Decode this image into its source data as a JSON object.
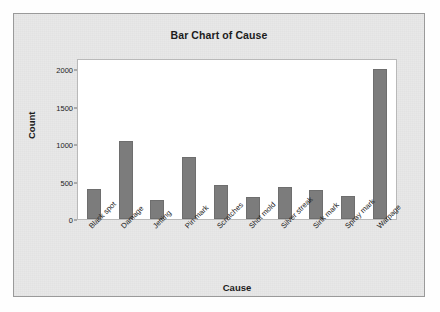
{
  "chart_data": {
    "type": "bar",
    "title": "Bar Chart of Cause",
    "xlabel": "Cause",
    "ylabel": "Count",
    "categories": [
      "Black spot",
      "Damage",
      "Jetting",
      "Pin mark",
      "Scratches",
      "Shot mold",
      "Silver streak",
      "Sink mark",
      "Spray mark",
      "Warpage"
    ],
    "values": [
      400,
      1040,
      260,
      830,
      450,
      290,
      430,
      390,
      310,
      2000
    ],
    "ylim": [
      0,
      2150
    ],
    "yticks": [
      0,
      500,
      1000,
      1500,
      2000
    ],
    "ytick_labels": [
      "0",
      "500",
      "1000",
      "1500",
      "2000"
    ],
    "grid": false,
    "legend": "none",
    "bar_color": "#7c7c7c",
    "plot_background": "#ffffff",
    "panel_background": "#e8e8e8"
  }
}
